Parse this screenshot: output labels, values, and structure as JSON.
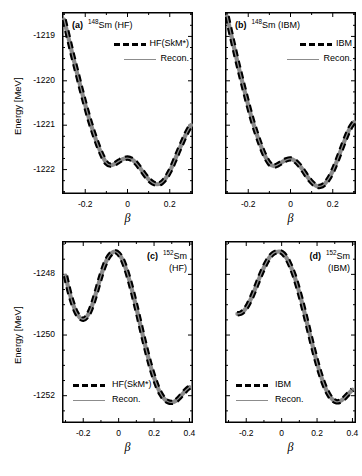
{
  "figure": {
    "width": 362,
    "height": 476,
    "background": "#ffffff",
    "line_color_hf": "#000000",
    "line_color_recon": "#8c8c8c"
  },
  "axis_labels": {
    "y": "Energy [MeV]",
    "x": "β"
  },
  "panels": [
    {
      "id": "a",
      "tag": "(a)",
      "nuclide_mass": "148",
      "nuclide_symbol": "Sm",
      "model": "(HF)",
      "title_lines": [
        "(a)  148Sm (HF)"
      ],
      "legend": [
        {
          "label": "HF(SkM*)",
          "style": "dashed"
        },
        {
          "label": "Recon.",
          "style": "solid"
        }
      ],
      "xticks": [
        "-0.2",
        "0",
        "0.2"
      ],
      "xtick_values": [
        -0.2,
        0,
        0.2
      ],
      "yticks": [
        "-1219",
        "-1220",
        "-1221",
        "-1222"
      ],
      "ytick_values": [
        -1219,
        -1220,
        -1221,
        -1222
      ],
      "xlim": [
        -0.31,
        0.31
      ],
      "ylim": [
        -1222.55,
        -1218.45
      ]
    },
    {
      "id": "b",
      "tag": "(b)",
      "nuclide_mass": "148",
      "nuclide_symbol": "Sm",
      "model": "(IBM)",
      "title_lines": [
        "(b)  148Sm (IBM)"
      ],
      "legend": [
        {
          "label": "IBM",
          "style": "dashed"
        },
        {
          "label": "Recon.",
          "style": "solid"
        }
      ],
      "xticks": [
        "-0.2",
        "0",
        "0.2"
      ],
      "xtick_values": [
        -0.2,
        0,
        0.2
      ],
      "yticks": [],
      "ytick_values": [
        -1219,
        -1220,
        -1221,
        -1222
      ],
      "xlim": [
        -0.31,
        0.31
      ],
      "ylim": [
        -1222.55,
        -1218.45
      ]
    },
    {
      "id": "c",
      "tag": "(c)",
      "nuclide_mass": "152",
      "nuclide_symbol": "Sm",
      "model": "(HF)",
      "title_lines": [
        "(c)  152Sm",
        "(HF)"
      ],
      "legend": [
        {
          "label": "HF(SkM*)",
          "style": "dashed"
        },
        {
          "label": "Recon.",
          "style": "solid"
        }
      ],
      "xticks": [
        "-0.2",
        "0",
        "0.2",
        "0.4"
      ],
      "xtick_values": [
        -0.2,
        0,
        0.2,
        0.4
      ],
      "yticks": [
        "-1248",
        "-1250",
        "-1252"
      ],
      "ytick_values": [
        -1248,
        -1250,
        -1252
      ],
      "xlim": [
        -0.32,
        0.42
      ],
      "ylim": [
        -1252.9,
        -1246.9
      ]
    },
    {
      "id": "d",
      "tag": "(d)",
      "nuclide_mass": "152",
      "nuclide_symbol": "Sm",
      "model": "(IBM)",
      "title_lines": [
        "(d)  152Sm",
        "(IBM)"
      ],
      "legend": [
        {
          "label": "IBM",
          "style": "dashed"
        },
        {
          "label": "Recon.",
          "style": "solid"
        }
      ],
      "xticks": [
        "-0.2",
        "0",
        "0.2",
        "0.4"
      ],
      "xtick_values": [
        -0.2,
        0,
        0.2,
        0.4
      ],
      "yticks": [],
      "ytick_values": [
        -1248,
        -1250,
        -1252
      ],
      "xlim": [
        -0.32,
        0.42
      ],
      "ylim": [
        -1252.9,
        -1246.9
      ]
    }
  ],
  "chart_data": [
    {
      "type": "line",
      "panel": "a",
      "title": "(a) 148Sm (HF)",
      "xlabel": "β",
      "ylabel": "Energy [MeV]",
      "xlim": [
        -0.31,
        0.31
      ],
      "ylim": [
        -1222.55,
        -1218.45
      ],
      "grid": false,
      "legend_position": "upper-right",
      "series": [
        {
          "name": "HF(SkM*)",
          "style": "dashed",
          "color": "#000000",
          "x": [
            -0.3,
            -0.28,
            -0.26,
            -0.24,
            -0.22,
            -0.2,
            -0.18,
            -0.16,
            -0.14,
            -0.12,
            -0.1,
            -0.08,
            -0.06,
            -0.04,
            -0.02,
            0.0,
            0.02,
            0.04,
            0.06,
            0.08,
            0.1,
            0.12,
            0.14,
            0.16,
            0.18,
            0.2,
            0.22,
            0.24,
            0.26,
            0.28,
            0.3
          ],
          "y": [
            -1218.62,
            -1219.02,
            -1219.42,
            -1219.8,
            -1220.18,
            -1220.54,
            -1220.88,
            -1221.18,
            -1221.45,
            -1221.68,
            -1221.85,
            -1221.9,
            -1221.87,
            -1221.81,
            -1221.76,
            -1221.74,
            -1221.77,
            -1221.85,
            -1221.97,
            -1222.1,
            -1222.22,
            -1222.3,
            -1222.33,
            -1222.3,
            -1222.2,
            -1222.04,
            -1221.83,
            -1221.6,
            -1221.38,
            -1221.17,
            -1221.0
          ]
        },
        {
          "name": "Recon.",
          "style": "solid",
          "color": "#8c8c8c",
          "x": [
            -0.3,
            -0.28,
            -0.26,
            -0.24,
            -0.22,
            -0.2,
            -0.18,
            -0.16,
            -0.14,
            -0.12,
            -0.1,
            -0.08,
            -0.06,
            -0.04,
            -0.02,
            0.0,
            0.02,
            0.04,
            0.06,
            0.08,
            0.1,
            0.12,
            0.14,
            0.16,
            0.18,
            0.2,
            0.22,
            0.24,
            0.26,
            0.28,
            0.3
          ],
          "y": [
            -1218.62,
            -1219.02,
            -1219.42,
            -1219.8,
            -1220.18,
            -1220.54,
            -1220.88,
            -1221.18,
            -1221.45,
            -1221.68,
            -1221.85,
            -1221.9,
            -1221.87,
            -1221.81,
            -1221.76,
            -1221.74,
            -1221.77,
            -1221.85,
            -1221.97,
            -1222.1,
            -1222.22,
            -1222.3,
            -1222.33,
            -1222.3,
            -1222.2,
            -1222.04,
            -1221.83,
            -1221.6,
            -1221.38,
            -1221.17,
            -1221.0
          ]
        }
      ]
    },
    {
      "type": "line",
      "panel": "b",
      "title": "(b) 148Sm (IBM)",
      "xlabel": "β",
      "ylabel": "Energy [MeV]",
      "xlim": [
        -0.31,
        0.31
      ],
      "ylim": [
        -1222.55,
        -1218.45
      ],
      "grid": false,
      "legend_position": "upper-right",
      "series": [
        {
          "name": "IBM",
          "style": "dashed",
          "color": "#000000",
          "x": [
            -0.3,
            -0.28,
            -0.26,
            -0.24,
            -0.22,
            -0.2,
            -0.18,
            -0.16,
            -0.14,
            -0.12,
            -0.1,
            -0.08,
            -0.06,
            -0.04,
            -0.02,
            0.0,
            0.02,
            0.04,
            0.06,
            0.08,
            0.1,
            0.12,
            0.14,
            0.16,
            0.18,
            0.2,
            0.22,
            0.24,
            0.26,
            0.28,
            0.3
          ],
          "y": [
            -1218.55,
            -1218.98,
            -1219.4,
            -1219.8,
            -1220.18,
            -1220.55,
            -1220.9,
            -1221.2,
            -1221.47,
            -1221.7,
            -1221.86,
            -1221.92,
            -1221.89,
            -1221.83,
            -1221.78,
            -1221.76,
            -1221.8,
            -1221.89,
            -1222.02,
            -1222.16,
            -1222.28,
            -1222.36,
            -1222.38,
            -1222.33,
            -1222.21,
            -1222.03,
            -1221.8,
            -1221.55,
            -1221.3,
            -1221.08,
            -1220.93
          ]
        },
        {
          "name": "Recon.",
          "style": "solid",
          "color": "#8c8c8c",
          "x": [
            -0.3,
            -0.28,
            -0.26,
            -0.24,
            -0.22,
            -0.2,
            -0.18,
            -0.16,
            -0.14,
            -0.12,
            -0.1,
            -0.08,
            -0.06,
            -0.04,
            -0.02,
            0.0,
            0.02,
            0.04,
            0.06,
            0.08,
            0.1,
            0.12,
            0.14,
            0.16,
            0.18,
            0.2,
            0.22,
            0.24,
            0.26,
            0.28,
            0.3
          ],
          "y": [
            -1218.55,
            -1218.98,
            -1219.4,
            -1219.8,
            -1220.18,
            -1220.55,
            -1220.9,
            -1221.2,
            -1221.47,
            -1221.7,
            -1221.86,
            -1221.92,
            -1221.89,
            -1221.83,
            -1221.78,
            -1221.76,
            -1221.8,
            -1221.89,
            -1222.02,
            -1222.16,
            -1222.28,
            -1222.36,
            -1222.38,
            -1222.33,
            -1222.21,
            -1222.03,
            -1221.8,
            -1221.55,
            -1221.3,
            -1221.08,
            -1220.93
          ]
        }
      ]
    },
    {
      "type": "line",
      "panel": "c",
      "title": "(c) 152Sm (HF)",
      "xlabel": "β",
      "ylabel": "Energy [MeV]",
      "xlim": [
        -0.32,
        0.42
      ],
      "ylim": [
        -1252.9,
        -1246.9
      ],
      "grid": false,
      "legend_position": "lower-left",
      "series": [
        {
          "name": "HF(SkM*)",
          "style": "dashed",
          "color": "#000000",
          "x": [
            -0.3,
            -0.28,
            -0.26,
            -0.24,
            -0.22,
            -0.2,
            -0.18,
            -0.16,
            -0.14,
            -0.12,
            -0.1,
            -0.08,
            -0.06,
            -0.04,
            -0.02,
            0.0,
            0.02,
            0.04,
            0.06,
            0.08,
            0.1,
            0.12,
            0.14,
            0.16,
            0.18,
            0.2,
            0.22,
            0.24,
            0.26,
            0.28,
            0.3,
            0.32,
            0.34,
            0.36,
            0.38,
            0.4
          ],
          "y": [
            -1248.05,
            -1248.55,
            -1248.95,
            -1249.25,
            -1249.42,
            -1249.48,
            -1249.4,
            -1249.18,
            -1248.85,
            -1248.45,
            -1248.05,
            -1247.7,
            -1247.45,
            -1247.3,
            -1247.25,
            -1247.32,
            -1247.5,
            -1247.8,
            -1248.18,
            -1248.62,
            -1249.1,
            -1249.6,
            -1250.1,
            -1250.58,
            -1251.02,
            -1251.4,
            -1251.72,
            -1251.96,
            -1252.12,
            -1252.2,
            -1252.22,
            -1252.18,
            -1252.08,
            -1251.95,
            -1251.82,
            -1251.72
          ]
        },
        {
          "name": "Recon.",
          "style": "solid",
          "color": "#8c8c8c",
          "x": [
            -0.3,
            -0.28,
            -0.26,
            -0.24,
            -0.22,
            -0.2,
            -0.18,
            -0.16,
            -0.14,
            -0.12,
            -0.1,
            -0.08,
            -0.06,
            -0.04,
            -0.02,
            0.0,
            0.02,
            0.04,
            0.06,
            0.08,
            0.1,
            0.12,
            0.14,
            0.16,
            0.18,
            0.2,
            0.22,
            0.24,
            0.26,
            0.28,
            0.3,
            0.32,
            0.34,
            0.36,
            0.38,
            0.4
          ],
          "y": [
            -1248.05,
            -1248.55,
            -1248.95,
            -1249.25,
            -1249.42,
            -1249.48,
            -1249.4,
            -1249.18,
            -1248.85,
            -1248.45,
            -1248.05,
            -1247.7,
            -1247.45,
            -1247.3,
            -1247.25,
            -1247.32,
            -1247.5,
            -1247.8,
            -1248.18,
            -1248.62,
            -1249.1,
            -1249.6,
            -1250.1,
            -1250.58,
            -1251.02,
            -1251.4,
            -1251.72,
            -1251.96,
            -1252.12,
            -1252.2,
            -1252.22,
            -1252.18,
            -1252.08,
            -1251.95,
            -1251.82,
            -1251.72
          ]
        }
      ]
    },
    {
      "type": "line",
      "panel": "d",
      "title": "(d) 152Sm (IBM)",
      "xlabel": "β",
      "ylabel": "Energy [MeV]",
      "xlim": [
        -0.32,
        0.42
      ],
      "ylim": [
        -1252.9,
        -1246.9
      ],
      "grid": false,
      "legend_position": "lower-left",
      "series": [
        {
          "name": "IBM",
          "style": "dashed",
          "color": "#000000",
          "x": [
            -0.25,
            -0.23,
            -0.21,
            -0.19,
            -0.17,
            -0.15,
            -0.13,
            -0.11,
            -0.09,
            -0.07,
            -0.05,
            -0.03,
            -0.01,
            0.01,
            0.03,
            0.05,
            0.07,
            0.09,
            0.11,
            0.13,
            0.15,
            0.17,
            0.19,
            0.21,
            0.23,
            0.25,
            0.27,
            0.29,
            0.31,
            0.33,
            0.35,
            0.37,
            0.39,
            0.4
          ],
          "y": [
            -1249.3,
            -1249.28,
            -1249.18,
            -1249.0,
            -1248.76,
            -1248.48,
            -1248.18,
            -1247.9,
            -1247.65,
            -1247.45,
            -1247.32,
            -1247.26,
            -1247.25,
            -1247.32,
            -1247.48,
            -1247.72,
            -1248.02,
            -1248.4,
            -1248.82,
            -1249.28,
            -1249.76,
            -1250.24,
            -1250.7,
            -1251.12,
            -1251.48,
            -1251.78,
            -1252.0,
            -1252.14,
            -1252.2,
            -1252.18,
            -1252.1,
            -1251.98,
            -1251.86,
            -1251.8
          ]
        },
        {
          "name": "Recon.",
          "style": "solid",
          "color": "#8c8c8c",
          "x": [
            -0.25,
            -0.23,
            -0.21,
            -0.19,
            -0.17,
            -0.15,
            -0.13,
            -0.11,
            -0.09,
            -0.07,
            -0.05,
            -0.03,
            -0.01,
            0.01,
            0.03,
            0.05,
            0.07,
            0.09,
            0.11,
            0.13,
            0.15,
            0.17,
            0.19,
            0.21,
            0.23,
            0.25,
            0.27,
            0.29,
            0.31,
            0.33,
            0.35,
            0.37,
            0.39,
            0.4
          ],
          "y": [
            -1249.3,
            -1249.28,
            -1249.18,
            -1249.0,
            -1248.76,
            -1248.48,
            -1248.18,
            -1247.9,
            -1247.65,
            -1247.45,
            -1247.32,
            -1247.26,
            -1247.25,
            -1247.32,
            -1247.48,
            -1247.72,
            -1248.02,
            -1248.4,
            -1248.82,
            -1249.28,
            -1249.76,
            -1250.24,
            -1250.7,
            -1251.12,
            -1251.48,
            -1251.78,
            -1252.0,
            -1252.14,
            -1252.2,
            -1252.18,
            -1252.1,
            -1251.98,
            -1251.86,
            -1251.8
          ]
        }
      ]
    }
  ]
}
